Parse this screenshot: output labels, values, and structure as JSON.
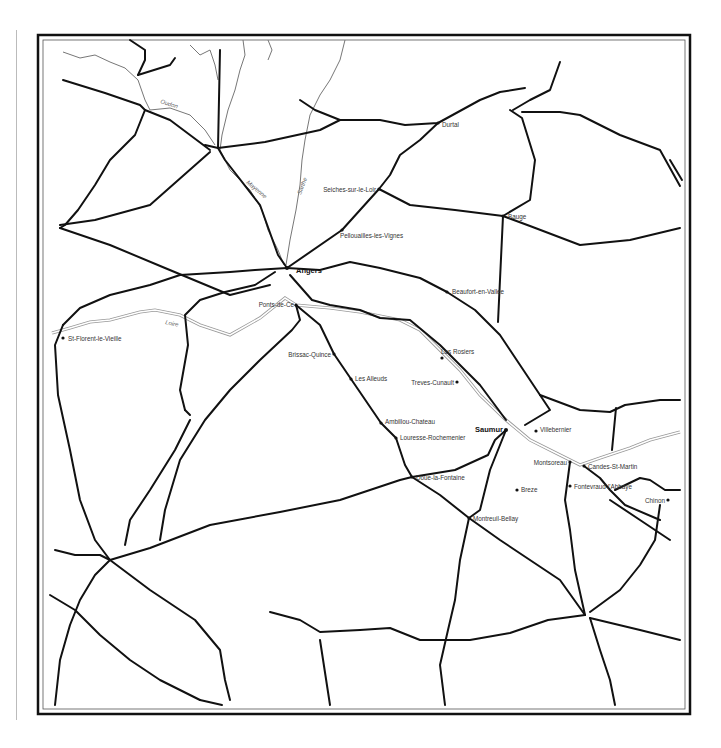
{
  "map": {
    "frame": {
      "outer": [
        38,
        35,
        652,
        679
      ],
      "inner": [
        43,
        40,
        642,
        669
      ]
    },
    "towns": [
      {
        "name": "Durtal",
        "x": 438,
        "y": 123,
        "lx": 442,
        "ly": 127,
        "anchor": "start"
      },
      {
        "name": "Seiches-sur-le-Loir",
        "x": 379,
        "y": 189,
        "lx": 376,
        "ly": 192,
        "anchor": "end"
      },
      {
        "name": "Bauge",
        "x": 503,
        "y": 216,
        "lx": 508,
        "ly": 219,
        "anchor": "start"
      },
      {
        "name": "Pellouailles-les-Vignes",
        "x": 342,
        "y": 230,
        "lx": 340,
        "ly": 238,
        "anchor": "start"
      },
      {
        "name": "Angers",
        "x": 287,
        "y": 268,
        "lx": 296,
        "ly": 273,
        "anchor": "start",
        "big": true
      },
      {
        "name": "Beaufort-en-Vallee",
        "x": 447,
        "y": 292,
        "lx": 452,
        "ly": 294,
        "anchor": "start"
      },
      {
        "name": "Ponts-de-Ce",
        "x": 296,
        "y": 305,
        "lx": 294,
        "ly": 307,
        "anchor": "end"
      },
      {
        "name": "St-Florent-le-Vieille",
        "x": 63,
        "y": 338,
        "lx": 68,
        "ly": 341,
        "anchor": "start"
      },
      {
        "name": "Brissac-Quince",
        "x": 334,
        "y": 354,
        "lx": 331,
        "ly": 357,
        "anchor": "end"
      },
      {
        "name": "Les Rosiers",
        "x": 442,
        "y": 358,
        "lx": 441,
        "ly": 354,
        "anchor": "start"
      },
      {
        "name": "Les Alleuds",
        "x": 351,
        "y": 379,
        "lx": 355,
        "ly": 381,
        "anchor": "start"
      },
      {
        "name": "Treves-Cunault",
        "x": 457,
        "y": 382,
        "lx": 454,
        "ly": 385,
        "anchor": "end"
      },
      {
        "name": "Ambillou-Chateau",
        "x": 381,
        "y": 423,
        "lx": 385,
        "ly": 424,
        "anchor": "start"
      },
      {
        "name": "Saumur",
        "x": 506,
        "y": 430,
        "lx": 503,
        "ly": 432,
        "anchor": "end",
        "big": true
      },
      {
        "name": "Villebernier",
        "x": 536,
        "y": 431,
        "lx": 540,
        "ly": 432,
        "anchor": "start"
      },
      {
        "name": "Louresse-Rochemenier",
        "x": 396,
        "y": 438,
        "lx": 400,
        "ly": 440,
        "anchor": "start"
      },
      {
        "name": "Montsoreau",
        "x": 570,
        "y": 462,
        "lx": 567,
        "ly": 465,
        "anchor": "end"
      },
      {
        "name": "Candes-St-Martin",
        "x": 584,
        "y": 466,
        "lx": 588,
        "ly": 469,
        "anchor": "start"
      },
      {
        "name": "Doue-la-Fontaine",
        "x": 412,
        "y": 477,
        "lx": 416,
        "ly": 480,
        "anchor": "start"
      },
      {
        "name": "Fontevraud-l'Abbaye",
        "x": 570,
        "y": 486,
        "lx": 574,
        "ly": 489,
        "anchor": "start"
      },
      {
        "name": "Breze",
        "x": 517,
        "y": 490,
        "lx": 521,
        "ly": 492,
        "anchor": "start"
      },
      {
        "name": "Chinon",
        "x": 668,
        "y": 500,
        "lx": 665,
        "ly": 503,
        "anchor": "end"
      },
      {
        "name": "Montreuil-Bellay",
        "x": 469,
        "y": 518,
        "lx": 473,
        "ly": 521,
        "anchor": "start"
      }
    ],
    "rivers": [
      {
        "name": "Oudon",
        "lx": 160,
        "ly": 103,
        "rot": 18
      },
      {
        "name": "Mayenne",
        "lx": 246,
        "ly": 183,
        "rot": 40
      },
      {
        "name": "Sarthe",
        "lx": 301,
        "ly": 195,
        "rot": -70
      },
      {
        "name": "Loire",
        "lx": 165,
        "ly": 324,
        "rot": 12
      }
    ],
    "roads": [
      "M63,80 L105,93 L140,105 L145,110",
      "M130,40 L145,50 L145,60 L138,75",
      "M138,75 L170,65 L175,58",
      "M145,110 L135,135 L110,160 L95,185 L78,210 L65,225 L60,228",
      "M145,110 L170,120 L190,135 L210,150",
      "M60,225 L95,220 L150,205 L210,152",
      "M60,228 L110,245 L165,268 L230,295 L270,285",
      "M220,50 L218,148 L225,160 L260,205 L278,255 L287,268",
      "M218,148 L265,142 L320,130 L340,120 L380,120 L405,125 L438,123 L480,100 L500,92 L525,88",
      "M218,148 L205,145",
      "M340,120 L315,110 L300,100",
      "M438,123 L420,140 L400,155 L390,175 L379,189",
      "M379,189 L342,230 L287,268",
      "M379,189 L410,205 L455,210 L503,216 L530,200 L535,160 L522,118 L510,110",
      "M513,110 L530,100 L550,90 L560,62",
      "M522,112 L560,112 L580,115 L620,135 L660,150 L680,186",
      "M503,216 L530,226 L580,245 L630,240 L680,228",
      "M503,216 L498,322",
      "M287,268 L320,270 L350,262 L380,268 L420,278 L447,292 L475,310 L500,335 L520,365 L540,395",
      "M290,275 L312,300 L330,305 L360,310 L380,318 L410,320 L440,345 L480,385 L506,420",
      "M287,268 L255,270 L230,272 L180,275 L150,285 L110,295 L80,308 L63,325",
      "M275,272 L255,285 L225,292 L200,300 L185,315 L188,345 L180,390 L185,410",
      "M63,325 L55,345 L58,395 L70,450 L80,500 L95,540 L110,560",
      "M296,305 L300,320 L292,330 L260,360 L230,390 L205,420 L180,460 L165,510 L160,540",
      "M296,305 L320,325 L334,354 L351,379 L381,423 L396,438 L405,465 L412,477",
      "M110,560 L150,548 L210,525 L280,512 L340,500 L400,480 L412,477 L455,470 L488,455 L495,440 L506,430",
      "M412,477 L440,495 L469,518 L500,540 L560,580 L585,615",
      "M469,518 L460,560 L455,600 L448,630 L440,665 L445,705",
      "M506,430 L490,470 L480,510 L469,518",
      "M540,395 L550,410 L525,425",
      "M540,395 L580,410 L610,412 L625,405 L660,400 L680,400",
      "M616,408 L612,450",
      "M570,462 L565,500 L570,530 L575,570 L585,615",
      "M584,466 L600,478 L610,490 L625,505 L660,520",
      "M615,490 L640,478 L650,480 L665,490 L680,490",
      "M590,612 L620,590 L640,565 L655,540 L660,505",
      "M585,615 L548,620 L510,633 L470,640 L440,640 L420,640 L390,628 L360,630 L320,632 L300,620 L270,612",
      "M590,618 L600,650 L610,680 L615,705",
      "M110,560 L95,575 L80,600 L70,625 L60,660 L55,705",
      "M110,560 L100,555 L75,555 L55,550",
      "M110,560 L150,590 L195,620 L220,650 L225,680 L230,700",
      "M50,595 L75,610 L100,635 L130,660 L160,680 L200,700",
      "M200,700 L222,705",
      "M125,545 L130,520 L150,490 L175,450 L190,420",
      "M185,410 L190,415",
      "M320,640 L330,705",
      "M590,618 L640,630 L680,640",
      "M610,500 L640,520 L670,540",
      "M682,180 L670,160"
    ],
    "river_paths": [
      "M63,52 L80,58 L95,55 L110,62 L125,68 L138,80 L145,100 L150,110 L170,108 L190,115 L205,130 L215,145",
      "M243,40 L245,55 L240,70 L235,90 L228,110 L222,135 L220,150 L230,170 L250,190 L262,210 L268,230 L278,250 L284,265",
      "M345,40 L340,60 L330,80 L320,95 L310,115 L305,140 L302,160 L300,185 L296,210 L290,240 L286,265",
      "M190,45 L200,55 L210,50 L215,65 L218,80",
      "M268,40 L272,50 L268,60",
      "M52,333 L70,328 L90,322 L110,320 L140,312 L155,310 L180,315 L200,325 L230,335 L260,318 L285,298 L296,305 L330,308 L360,312 L400,320 L420,330 L440,350 L460,370 L480,395 L506,420 L530,440 L560,455 L580,465 L600,458 L630,448 L650,440 L680,432"
    ]
  }
}
